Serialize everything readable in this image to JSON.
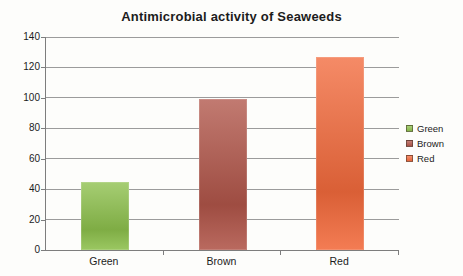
{
  "title": "Antimicrobial activity of Seaweeds",
  "chart_data": {
    "type": "bar",
    "title": "Antimicrobial activity of Seaweeds",
    "categories": [
      "Green",
      "Brown",
      "Red"
    ],
    "values": [
      45,
      99,
      127
    ],
    "series_colors": [
      "#8dc04c",
      "#b05549",
      "#f26a3c"
    ],
    "xlabel": "",
    "ylabel": "",
    "ylim": [
      0,
      140
    ],
    "yticks": [
      0,
      20,
      40,
      60,
      80,
      100,
      120,
      140
    ],
    "grid": true,
    "legend": {
      "position": "right",
      "entries": [
        {
          "label": "Green",
          "color": "#8dc04c"
        },
        {
          "label": "Brown",
          "color": "#b05549"
        },
        {
          "label": "Red",
          "color": "#f26a3c"
        }
      ]
    }
  },
  "colors": {
    "background": "#fdfdfb",
    "grid": "#9b9b9b",
    "axis": "#7d7d7d",
    "text": "#1c1c1c"
  }
}
